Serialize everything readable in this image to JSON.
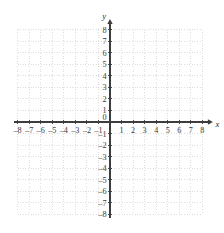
{
  "figure": {
    "title": "",
    "background_color": "#ffffff"
  },
  "chart_data": {
    "type": "scatter",
    "title": "",
    "subtitle": "",
    "xlabel": "x",
    "ylabel": "y",
    "xlim": [
      -8,
      8
    ],
    "ylim": [
      -8,
      8
    ],
    "x_ticks": [
      -8,
      -7,
      -6,
      -5,
      -4,
      -3,
      -2,
      -1,
      1,
      2,
      3,
      4,
      5,
      6,
      7,
      8
    ],
    "y_ticks": [
      -8,
      -7,
      -6,
      -5,
      -4,
      -3,
      -2,
      -1,
      1,
      2,
      3,
      4,
      5,
      6,
      7,
      8
    ],
    "x_tick_labels": [
      "–8",
      "–7",
      "–6",
      "–5",
      "–4",
      "–3",
      "–2",
      "–1",
      "1",
      "2",
      "3",
      "4",
      "5",
      "6",
      "7",
      "8"
    ],
    "y_tick_labels": [
      "–8",
      "–7",
      "–6",
      "–5",
      "–4",
      "–3",
      "–2",
      "–1",
      "1",
      "2",
      "3",
      "4",
      "5",
      "6",
      "7",
      "8"
    ],
    "origin_label": "0",
    "grid": true,
    "grid_style": "dotted",
    "grid_step": 1,
    "legend": null,
    "series": [],
    "annotations": [],
    "axis_arrows": [
      "x-positive",
      "y-positive"
    ]
  },
  "style": {
    "grid_color": "#cfcfcf",
    "axis_color": "#3d3d3d",
    "label_color": "#3a3a3a",
    "axis_label_color": "#2b2b2b",
    "background_color": "#ffffff"
  },
  "geometry": {
    "origin_x": 110,
    "origin_y": 122,
    "unit_px": 11.55
  }
}
